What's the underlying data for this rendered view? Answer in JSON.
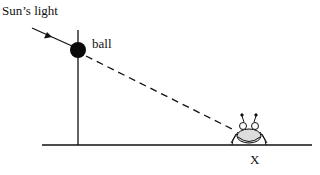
{
  "diagram": {
    "labels": {
      "sun_light": "Sun’s light",
      "ball": "ball",
      "position": "X"
    },
    "elements": {
      "pole": "vertical pole",
      "ball": "ball on pole",
      "ground": "ground line",
      "shadow_ray": "dashed line from ball to X",
      "insect": "insect at position X"
    },
    "colors": {
      "line": "#111111",
      "ball": "#0a0a0a",
      "background": "#ffffff"
    }
  }
}
